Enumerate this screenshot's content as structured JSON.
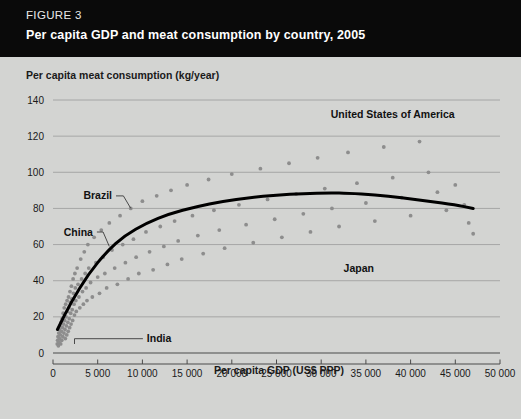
{
  "header": {
    "figure_number": "FIGURE 3",
    "title": "Per capita GDP and meat consumption by country, 2005",
    "background_color": "#0a0a0a",
    "text_color": "#ffffff"
  },
  "page": {
    "background_color": "#d3d4d2"
  },
  "chart_data": {
    "type": "scatter",
    "title": "Per capita GDP and meat consumption by country, 2005",
    "xlabel": "Per capita GDP (US$ PPP)",
    "ylabel": "Per capita meat consumption (kg/year)",
    "xlim": [
      0,
      50000
    ],
    "ylim": [
      0,
      140
    ],
    "grid": true,
    "legend": "none",
    "xticks": [
      0,
      5000,
      10000,
      15000,
      20000,
      25000,
      30000,
      35000,
      40000,
      45000,
      50000
    ],
    "xticklabels": [
      "0",
      "5 000",
      "10 000",
      "15 000",
      "20 000",
      "25 000",
      "30 000",
      "35 000",
      "40 000",
      "45 000",
      "50 000"
    ],
    "yticks": [
      0,
      20,
      40,
      60,
      80,
      100,
      120,
      140
    ],
    "yticklabels": [
      "0",
      "20",
      "40",
      "60",
      "80",
      "100",
      "120",
      "140"
    ],
    "point_color": "#8d8d8d",
    "trend_color": "#000000",
    "series": [
      {
        "name": "Countries",
        "marker": "circle",
        "points": [
          [
            480,
            5
          ],
          [
            520,
            7
          ],
          [
            560,
            9
          ],
          [
            600,
            4
          ],
          [
            640,
            11
          ],
          [
            680,
            6
          ],
          [
            700,
            13
          ],
          [
            740,
            8
          ],
          [
            780,
            15
          ],
          [
            820,
            10
          ],
          [
            860,
            5
          ],
          [
            900,
            17
          ],
          [
            940,
            12
          ],
          [
            980,
            7
          ],
          [
            1020,
            19
          ],
          [
            1060,
            14
          ],
          [
            1100,
            9
          ],
          [
            1140,
            22
          ],
          [
            1180,
            16
          ],
          [
            1220,
            11
          ],
          [
            1260,
            25
          ],
          [
            1300,
            18
          ],
          [
            1340,
            13
          ],
          [
            1380,
            8
          ],
          [
            1420,
            27
          ],
          [
            1460,
            20
          ],
          [
            1500,
            15
          ],
          [
            1540,
            10
          ],
          [
            1580,
            29
          ],
          [
            1620,
            23
          ],
          [
            1660,
            17
          ],
          [
            1700,
            12
          ],
          [
            1740,
            31
          ],
          [
            1780,
            25
          ],
          [
            1820,
            19
          ],
          [
            1860,
            14
          ],
          [
            1900,
            34
          ],
          [
            1940,
            28
          ],
          [
            1980,
            22
          ],
          [
            2020,
            16
          ],
          [
            2060,
            37
          ],
          [
            2100,
            30
          ],
          [
            2150,
            24
          ],
          [
            2200,
            18
          ],
          [
            2250,
            41
          ],
          [
            2300,
            33
          ],
          [
            2350,
            27
          ],
          [
            2400,
            21
          ],
          [
            2450,
            44
          ],
          [
            2500,
            36
          ],
          [
            2550,
            29
          ],
          [
            2600,
            23
          ],
          [
            2700,
            47
          ],
          [
            2800,
            38
          ],
          [
            2900,
            31
          ],
          [
            3000,
            25
          ],
          [
            3100,
            52
          ],
          [
            3200,
            41
          ],
          [
            3300,
            34
          ],
          [
            3400,
            27
          ],
          [
            3500,
            56
          ],
          [
            3600,
            44
          ],
          [
            3700,
            36
          ],
          [
            3800,
            29
          ],
          [
            3900,
            60
          ],
          [
            4000,
            47
          ],
          [
            4200,
            39
          ],
          [
            4400,
            31
          ],
          [
            4600,
            64
          ],
          [
            4800,
            50
          ],
          [
            5000,
            42
          ],
          [
            5200,
            33
          ],
          [
            5400,
            68
          ],
          [
            5600,
            53
          ],
          [
            5800,
            44
          ],
          [
            6000,
            36
          ],
          [
            6300,
            72
          ],
          [
            6600,
            57
          ],
          [
            6900,
            47
          ],
          [
            7200,
            38
          ],
          [
            7500,
            76
          ],
          [
            7800,
            60
          ],
          [
            8100,
            50
          ],
          [
            8400,
            41
          ],
          [
            8700,
            80
          ],
          [
            9000,
            63
          ],
          [
            9300,
            53
          ],
          [
            9600,
            44
          ],
          [
            10000,
            84
          ],
          [
            10400,
            67
          ],
          [
            10800,
            56
          ],
          [
            11200,
            46
          ],
          [
            11600,
            87
          ],
          [
            12000,
            70
          ],
          [
            12400,
            59
          ],
          [
            12800,
            49
          ],
          [
            13200,
            90
          ],
          [
            13600,
            73
          ],
          [
            14000,
            62
          ],
          [
            14400,
            52
          ],
          [
            15000,
            93
          ],
          [
            15600,
            76
          ],
          [
            16200,
            65
          ],
          [
            16800,
            55
          ],
          [
            17400,
            96
          ],
          [
            18000,
            79
          ],
          [
            18600,
            68
          ],
          [
            19200,
            58
          ],
          [
            20000,
            99
          ],
          [
            20800,
            82
          ],
          [
            21600,
            71
          ],
          [
            22400,
            61
          ],
          [
            23200,
            102
          ],
          [
            24000,
            85
          ],
          [
            24800,
            74
          ],
          [
            25600,
            64
          ],
          [
            26400,
            105
          ],
          [
            27200,
            88
          ],
          [
            28000,
            77
          ],
          [
            28800,
            67
          ],
          [
            29600,
            108
          ],
          [
            30400,
            91
          ],
          [
            31200,
            80
          ],
          [
            32000,
            70
          ],
          [
            33000,
            111
          ],
          [
            34000,
            94
          ],
          [
            35000,
            83
          ],
          [
            36000,
            73
          ],
          [
            37000,
            114
          ],
          [
            38000,
            97
          ],
          [
            39000,
            86
          ],
          [
            40000,
            76
          ],
          [
            41000,
            117
          ],
          [
            42000,
            100
          ],
          [
            43000,
            89
          ],
          [
            44000,
            79
          ],
          [
            45000,
            93
          ],
          [
            46000,
            82
          ],
          [
            46500,
            72
          ],
          [
            47000,
            66
          ]
        ]
      }
    ],
    "trend_line": {
      "name": "Fitted trend",
      "points": [
        [
          500,
          13
        ],
        [
          2000,
          28
        ],
        [
          4000,
          44
        ],
        [
          6000,
          56
        ],
        [
          8000,
          65
        ],
        [
          10500,
          72
        ],
        [
          13000,
          77
        ],
        [
          16000,
          81
        ],
        [
          19000,
          84
        ],
        [
          22000,
          86
        ],
        [
          25000,
          87.5
        ],
        [
          28000,
          88.3
        ],
        [
          31000,
          88.6
        ],
        [
          33000,
          88.4
        ],
        [
          36000,
          87.5
        ],
        [
          39000,
          86
        ],
        [
          42000,
          84
        ],
        [
          45000,
          82
        ],
        [
          47000,
          80
        ]
      ]
    },
    "annotations": [
      {
        "label": "United States of America",
        "text_x": 38000,
        "text_y": 130,
        "point_x": 42200,
        "point_y": 124,
        "anchor": "middle",
        "leader": false
      },
      {
        "label": "Brazil",
        "text_x": 3400,
        "text_y": 85,
        "point_x": 8700,
        "point_y": 80,
        "anchor": "start",
        "leader": true
      },
      {
        "label": "China",
        "text_x": 1200,
        "text_y": 65,
        "point_x": 6300,
        "point_y": 59,
        "anchor": "start",
        "leader": true
      },
      {
        "label": "Japan",
        "text_x": 32500,
        "text_y": 45,
        "point_x": 31000,
        "point_y": 45,
        "anchor": "start",
        "leader": false
      },
      {
        "label": "India",
        "text_x": 10500,
        "text_y": 6,
        "point_x": 2400,
        "point_y": 5,
        "anchor": "start",
        "leader": true
      }
    ]
  }
}
